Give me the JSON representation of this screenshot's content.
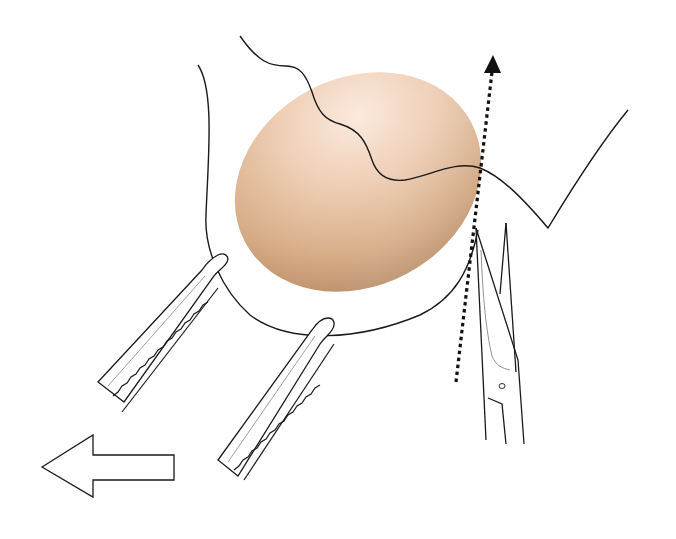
{
  "figure": {
    "kind": "surgical-illustration",
    "labels": [],
    "colors": {
      "background": "#ffffff",
      "line": "#1a1a1a",
      "mass_light": "#f3d7c6",
      "mass_mid": "#d9b08a",
      "mass_dark": "#a97c5a",
      "dotted_arrow": "#111111"
    },
    "elements": {
      "mass": "oval-tissue-mass",
      "clamps": [
        "left-forceps",
        "right-forceps"
      ],
      "scissors": "surgical-scissors",
      "dissection_line": "dotted-arrow-upward",
      "traction_arrow": "outline-arrow-left"
    }
  }
}
